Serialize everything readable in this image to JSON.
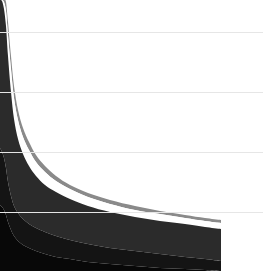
{
  "chart_data": {
    "type": "area",
    "title": "",
    "subtitle": "",
    "xlabel": "",
    "ylabel": "",
    "stacked": true,
    "grid": true,
    "legend": false,
    "legend_position": "none",
    "note": "Cropped view of a stacked area chart with steeply decaying power-law style curves. Axis tick labels and legend are outside the cropped region.",
    "xlim": [
      0,
      263
    ],
    "ylim": [
      271,
      0
    ],
    "x_data_end_px": 221,
    "gridlines_y_px": [
      32,
      92,
      152,
      212
    ],
    "gridline_color": "#e6e6e6",
    "background_color": "#ffffff",
    "x": [
      0,
      2,
      4,
      6,
      8,
      11,
      14,
      18,
      23,
      29,
      36,
      45,
      56,
      70,
      88,
      110,
      135,
      160,
      185,
      205,
      221
    ],
    "series": [
      {
        "name": "band-1-top-gray",
        "color": "#8a8a8a",
        "upper_y_px": [
          0,
          0,
          0,
          2,
          22,
          56,
          86,
          110,
          128,
          142,
          155,
          166,
          176,
          185,
          193,
          200,
          206,
          211,
          215,
          218,
          220
        ],
        "lower_y_px": [
          0,
          0,
          2,
          11,
          35,
          69,
          98,
          120,
          137,
          150,
          162,
          172,
          181,
          189,
          197,
          204,
          210,
          214,
          218,
          221,
          223
        ]
      },
      {
        "name": "band-2-white-gap",
        "color": "#ffffff",
        "upper_y_px": [
          0,
          0,
          2,
          11,
          35,
          69,
          98,
          120,
          137,
          150,
          162,
          172,
          181,
          189,
          197,
          204,
          210,
          214,
          218,
          221,
          223
        ],
        "lower_y_px": [
          0,
          1,
          9,
          26,
          56,
          92,
          119,
          139,
          154,
          166,
          176,
          185,
          192,
          199,
          206,
          212,
          217,
          221,
          224,
          227,
          229
        ]
      },
      {
        "name": "band-3-dark-gray",
        "color": "#2b2b2b",
        "upper_y_px": [
          0,
          1,
          9,
          26,
          56,
          92,
          119,
          139,
          154,
          166,
          176,
          185,
          192,
          199,
          206,
          212,
          217,
          221,
          224,
          227,
          229
        ],
        "lower_y_px": [
          148,
          152,
          158,
          168,
          182,
          196,
          206,
          213,
          219,
          224,
          228,
          232,
          236,
          240,
          244,
          248,
          251,
          254,
          257,
          259,
          261
        ]
      },
      {
        "name": "band-4-near-black",
        "color": "#141414",
        "upper_y_px": [
          148,
          152,
          158,
          168,
          182,
          196,
          206,
          213,
          219,
          224,
          228,
          232,
          236,
          240,
          244,
          248,
          251,
          254,
          257,
          259,
          261
        ],
        "lower_y_px": [
          205,
          207,
          210,
          215,
          222,
          230,
          236,
          241,
          245,
          248,
          251,
          254,
          257,
          259,
          262,
          264,
          266,
          268,
          269,
          270,
          271
        ]
      },
      {
        "name": "band-5-black-base",
        "color": "#080808",
        "upper_y_px": [
          205,
          207,
          210,
          215,
          222,
          230,
          236,
          241,
          245,
          248,
          251,
          254,
          257,
          259,
          262,
          264,
          266,
          268,
          269,
          270,
          271
        ],
        "lower_y_px": [
          271,
          271,
          271,
          271,
          271,
          271,
          271,
          271,
          271,
          271,
          271,
          271,
          271,
          271,
          271,
          271,
          271,
          271,
          271,
          271,
          271
        ]
      }
    ]
  }
}
